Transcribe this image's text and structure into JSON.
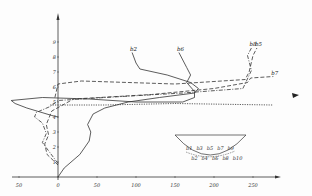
{
  "chart_data": {
    "type": "line",
    "title": "",
    "xlabel": "",
    "ylabel": "",
    "xlim": [
      -50,
      280
    ],
    "ylim": [
      0,
      10
    ],
    "grid": false,
    "x_ticks": [
      "50",
      "0",
      "50",
      "100",
      "150",
      "200",
      "250"
    ],
    "x_tick_values": [
      -50,
      0,
      50,
      100,
      150,
      200,
      250
    ],
    "y_ticks": [
      "1",
      "2",
      "3",
      "4",
      "5",
      "6",
      "7",
      "8",
      "9"
    ],
    "y_tick_values": [
      1,
      2,
      3,
      4,
      5,
      6,
      7,
      8,
      9
    ],
    "series": [
      {
        "name": "b2",
        "style": "solid",
        "points": [
          [
            0,
            0
          ],
          [
            8,
            0.6
          ],
          [
            28,
            1.5
          ],
          [
            40,
            2.4
          ],
          [
            42,
            3
          ],
          [
            38,
            3.5
          ],
          [
            45,
            4.2
          ],
          [
            60,
            4.6
          ],
          [
            90,
            5.0
          ],
          [
            130,
            5.3
          ],
          [
            175,
            5.6
          ],
          [
            180,
            5.9
          ],
          [
            170,
            6.3
          ],
          [
            140,
            6.8
          ],
          [
            105,
            7.2
          ],
          [
            100,
            7.6
          ],
          [
            95,
            8.3
          ]
        ]
      },
      {
        "name": "b6",
        "style": "solid",
        "points": [
          [
            0,
            4.0
          ],
          [
            -8,
            4.1
          ],
          [
            -40,
            4.6
          ],
          [
            -55,
            4.9
          ],
          [
            -60,
            5.1
          ],
          [
            -20,
            5.3
          ],
          [
            40,
            5.2
          ],
          [
            100,
            5.0
          ],
          [
            160,
            5.0
          ],
          [
            175,
            5.3
          ],
          [
            175,
            5.7
          ],
          [
            165,
            6.3
          ],
          [
            170,
            6.8
          ],
          [
            165,
            7.3
          ],
          [
            155,
            8.3
          ]
        ]
      },
      {
        "name": "b7",
        "style": "dashed",
        "points": [
          [
            0,
            0.8
          ],
          [
            -14,
            1.5
          ],
          [
            -17,
            2.2
          ],
          [
            -12,
            2.8
          ],
          [
            -15,
            3.5
          ],
          [
            -8,
            4.4
          ],
          [
            20,
            5.2
          ],
          [
            120,
            5.5
          ],
          [
            200,
            5.9
          ],
          [
            243,
            6.3
          ],
          [
            247,
            6.6
          ],
          [
            276,
            6.7
          ]
        ]
      },
      {
        "name": "b8",
        "style": "dash-dot",
        "points": [
          [
            0,
            0.9
          ],
          [
            -10,
            1.6
          ],
          [
            -20,
            2.3
          ],
          [
            -15,
            2.9
          ],
          [
            -20,
            3.6
          ],
          [
            -30,
            4.0
          ],
          [
            -28,
            4.3
          ],
          [
            -10,
            4.7
          ],
          [
            0,
            5.1
          ],
          [
            60,
            5.3
          ],
          [
            160,
            5.6
          ],
          [
            237,
            5.9
          ],
          [
            248,
            7.1
          ],
          [
            243,
            8.1
          ],
          [
            248,
            8.6
          ]
        ]
      },
      {
        "name": "b5",
        "style": "dashed",
        "points": [
          [
            -4,
            5.3
          ],
          [
            0,
            6.2
          ],
          [
            30,
            6.4
          ],
          [
            150,
            6.2
          ],
          [
            240,
            6.5
          ],
          [
            245,
            7.0
          ],
          [
            250,
            8.1
          ],
          [
            255,
            8.6
          ]
        ]
      },
      {
        "name": "reference",
        "style": "dotted",
        "points": [
          [
            -10,
            4.8
          ],
          [
            60,
            4.8
          ],
          [
            150,
            4.9
          ],
          [
            275,
            4.8
          ]
        ]
      }
    ],
    "labels": [
      "b2",
      "b6",
      "b7",
      "b8",
      "b5"
    ],
    "inset": {
      "type": "cross-section",
      "description": "semicircular channel cross-section with measurement point labels",
      "point_labels": [
        "b1",
        "b2",
        "b3",
        "b4",
        "b5",
        "b6",
        "b7",
        "b8",
        "b9",
        "b10"
      ]
    }
  }
}
